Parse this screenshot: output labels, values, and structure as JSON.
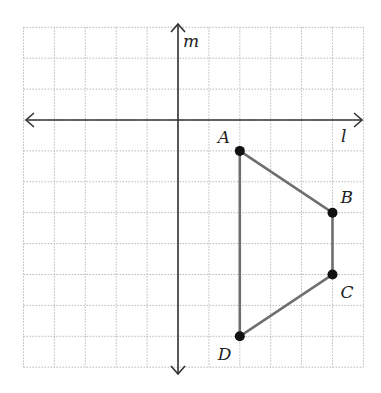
{
  "diagram": {
    "type": "coordinate-grid",
    "grid": {
      "x_min": -5,
      "x_max": 6,
      "y_min": -8,
      "y_max": 3,
      "step_px": 30.9,
      "origin_px": [
        178,
        120
      ]
    },
    "axes": {
      "horizontal_label": "l",
      "vertical_label": "m"
    },
    "polygon": {
      "name": "ABCD",
      "vertices": [
        {
          "label": "A",
          "x": 2,
          "y": -1
        },
        {
          "label": "B",
          "x": 5,
          "y": -3
        },
        {
          "label": "C",
          "x": 5,
          "y": -5
        },
        {
          "label": "D",
          "x": 2,
          "y": -7
        }
      ]
    },
    "colors": {
      "grid": "#b8b8b8",
      "axis": "#333333",
      "edge": "#6e6e6e",
      "point": "#111111"
    }
  }
}
